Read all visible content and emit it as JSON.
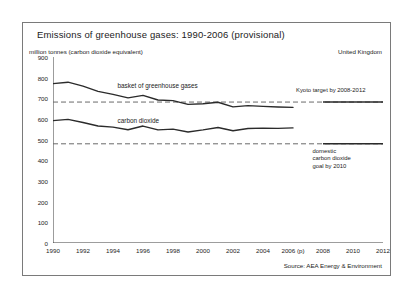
{
  "figure": {
    "title": "Emissions of greenhouse gases: 1990-2006 (provisional)",
    "unit_label": "million tonnes (carbon dioxide equivalent)",
    "region_label": "United Kingdom",
    "source_label": "Source: AEA Energy & Environment"
  },
  "chart_data": {
    "type": "line",
    "title": "Emissions of greenhouse gases: 1990-2006 (provisional)",
    "xlabel": "",
    "ylabel": "million tonnes (carbon dioxide equivalent)",
    "xlim": [
      1990,
      2012
    ],
    "ylim": [
      0,
      900
    ],
    "grid": false,
    "legend_position": "inline-annotations",
    "x_tick_labels": [
      "1990",
      "1992",
      "1994",
      "1996",
      "1998",
      "2000",
      "2002",
      "2004",
      "2006 (p)",
      "2008",
      "2010",
      "2012"
    ],
    "x_ticks": [
      1990,
      1992,
      1994,
      1996,
      1998,
      2000,
      2002,
      2004,
      2006,
      2008,
      2010,
      2012
    ],
    "y_ticks": [
      0,
      100,
      200,
      300,
      400,
      500,
      600,
      700,
      800,
      900
    ],
    "y_tick_labels": [
      "0",
      "100",
      "200",
      "300",
      "400",
      "500",
      "600",
      "700",
      "800",
      "900"
    ],
    "x": [
      1990,
      1991,
      1992,
      1993,
      1994,
      1995,
      1996,
      1997,
      1998,
      1999,
      2000,
      2001,
      2002,
      2003,
      2004,
      2005,
      2006
    ],
    "series": [
      {
        "name": "basket of greenhouse gases",
        "label": "basket of greenhouse gases",
        "color": "#2b2b2b",
        "values": [
          771,
          778,
          759,
          734,
          719,
          702,
          714,
          692,
          689,
          671,
          674,
          681,
          659,
          665,
          661,
          658,
          656
        ]
      },
      {
        "name": "carbon dioxide",
        "label": "carbon dioxide",
        "color": "#2b2b2b",
        "values": [
          592,
          598,
          583,
          566,
          561,
          548,
          566,
          547,
          551,
          537,
          547,
          559,
          543,
          554,
          556,
          555,
          557
        ]
      }
    ],
    "reference_lines": [
      {
        "name": "kyoto-target",
        "label": "Kyoto target by 2008-2012",
        "value": 682,
        "style": "dashed",
        "color": "#6a6a6a"
      },
      {
        "name": "domestic-co2-goal",
        "label": "domestic carbon dioxide goal by 2010",
        "label_lines": [
          "domestic",
          "carbon dioxide",
          "goal by 2010"
        ],
        "value": 480,
        "style": "dashed",
        "color": "#6a6a6a"
      }
    ]
  }
}
